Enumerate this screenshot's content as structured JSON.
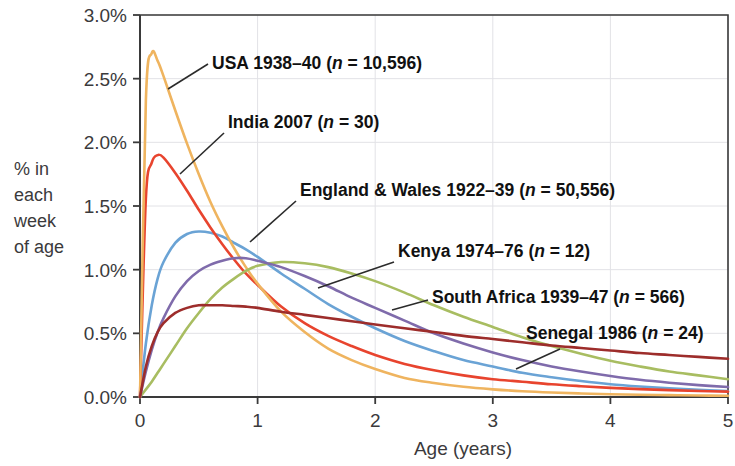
{
  "chart_data": {
    "type": "line",
    "title": "",
    "xlabel": "Age (years)",
    "ylabel": "% in each week of age",
    "ylabel_lines": [
      "% in",
      "each",
      "week",
      "of age"
    ],
    "xlim": [
      0,
      5
    ],
    "ylim": [
      0,
      3.0
    ],
    "grid": true,
    "legend_position": "inline-annotations",
    "x_ticks": [
      {
        "value": 0,
        "label": "0"
      },
      {
        "value": 1,
        "label": "1"
      },
      {
        "value": 2,
        "label": "2"
      },
      {
        "value": 3,
        "label": "3"
      },
      {
        "value": 4,
        "label": "4"
      },
      {
        "value": 5,
        "label": "5"
      }
    ],
    "y_ticks": [
      {
        "value": 0.0,
        "label": "0.0%"
      },
      {
        "value": 0.5,
        "label": "0.5%"
      },
      {
        "value": 1.0,
        "label": "1.0%"
      },
      {
        "value": 1.5,
        "label": "1.5%"
      },
      {
        "value": 2.0,
        "label": "2.0%"
      },
      {
        "value": 2.5,
        "label": "2.5%"
      },
      {
        "value": 3.0,
        "label": "3.0%"
      }
    ],
    "x": [
      0,
      0.05,
      0.1,
      0.15,
      0.2,
      0.3,
      0.4,
      0.5,
      0.6,
      0.7,
      0.8,
      0.9,
      1.0,
      1.2,
      1.4,
      1.6,
      1.8,
      2.0,
      2.25,
      2.5,
      2.75,
      3.0,
      3.25,
      3.5,
      3.75,
      4.0,
      4.25,
      4.5,
      4.75,
      5.0
    ],
    "series": [
      {
        "name": "USA 1938-40",
        "label": "USA 1938–40 (n = 10,596)",
        "label_prefix": "USA 1938–40 (",
        "label_italic": "n",
        "label_suffix": " = 10,596)",
        "n": "10,596",
        "color": "#efb45f",
        "peak_value": 2.7,
        "peak_age": 0.09,
        "values": [
          0.0,
          2.33,
          2.7,
          2.64,
          2.52,
          2.25,
          1.99,
          1.75,
          1.53,
          1.34,
          1.17,
          1.02,
          0.89,
          0.67,
          0.51,
          0.38,
          0.29,
          0.22,
          0.15,
          0.11,
          0.08,
          0.06,
          0.045,
          0.035,
          0.028,
          0.022,
          0.018,
          0.015,
          0.012,
          0.01
        ]
      },
      {
        "name": "India 2007",
        "label": "India 2007 (n = 30)",
        "label_prefix": "India 2007 (",
        "label_italic": "n",
        "label_suffix": " = 30)",
        "n": "30",
        "color": "#e8442e",
        "peak_value": 1.9,
        "peak_age": 0.13,
        "values": [
          0.0,
          1.56,
          1.84,
          1.9,
          1.88,
          1.76,
          1.62,
          1.47,
          1.33,
          1.2,
          1.08,
          0.97,
          0.88,
          0.71,
          0.58,
          0.48,
          0.4,
          0.33,
          0.26,
          0.21,
          0.17,
          0.14,
          0.12,
          0.1,
          0.085,
          0.072,
          0.062,
          0.054,
          0.047,
          0.042
        ]
      },
      {
        "name": "England & Wales 1922-39",
        "label": "England & Wales 1922–39 (n = 50,556)",
        "label_prefix": "England & Wales 1922–39 (",
        "label_italic": "n",
        "label_suffix": " = 50,556)",
        "n": "50,556",
        "color": "#6aa3d5",
        "peak_value": 1.3,
        "peak_age": 0.48,
        "values": [
          0.0,
          0.42,
          0.72,
          0.93,
          1.06,
          1.21,
          1.28,
          1.3,
          1.29,
          1.26,
          1.21,
          1.16,
          1.1,
          0.97,
          0.85,
          0.73,
          0.63,
          0.54,
          0.44,
          0.36,
          0.29,
          0.24,
          0.19,
          0.155,
          0.125,
          0.1,
          0.082,
          0.068,
          0.056,
          0.047
        ]
      },
      {
        "name": "Kenya 1974-76",
        "label": "Kenya 1974–76 (n = 12)",
        "label_prefix": "Kenya 1974–76 (",
        "label_italic": "n",
        "label_suffix": " = 12)",
        "n": "12",
        "color": "#7f6bab",
        "peak_value": 1.09,
        "peak_age": 0.8,
        "values": [
          0.0,
          0.2,
          0.37,
          0.51,
          0.62,
          0.79,
          0.91,
          0.99,
          1.04,
          1.07,
          1.09,
          1.09,
          1.07,
          1.02,
          0.95,
          0.87,
          0.78,
          0.7,
          0.6,
          0.5,
          0.42,
          0.35,
          0.29,
          0.24,
          0.2,
          0.165,
          0.135,
          0.112,
          0.093,
          0.078
        ]
      },
      {
        "name": "South Africa 1939-47",
        "label": "South Africa 1939–47 (n = 566)",
        "label_prefix": "South Africa 1939–47 (",
        "label_italic": "n",
        "label_suffix": " = 566)",
        "n": "566",
        "color": "#9d2d2b",
        "peak_value": 0.72,
        "peak_age": 0.62,
        "values": [
          0.0,
          0.24,
          0.4,
          0.51,
          0.58,
          0.66,
          0.7,
          0.72,
          0.72,
          0.72,
          0.715,
          0.71,
          0.7,
          0.67,
          0.645,
          0.62,
          0.595,
          0.57,
          0.54,
          0.51,
          0.48,
          0.455,
          0.43,
          0.405,
          0.385,
          0.365,
          0.345,
          0.33,
          0.315,
          0.3
        ]
      },
      {
        "name": "Senegal 1986",
        "label": "Senegal 1986 (n = 24)",
        "label_prefix": "Senegal 1986 (",
        "label_italic": "n",
        "label_suffix": " = 24)",
        "n": "24",
        "color": "#a8bd61",
        "peak_value": 1.06,
        "peak_age": 1.18,
        "values": [
          0.0,
          0.06,
          0.12,
          0.19,
          0.26,
          0.4,
          0.54,
          0.66,
          0.77,
          0.86,
          0.93,
          0.99,
          1.03,
          1.06,
          1.05,
          1.02,
          0.97,
          0.91,
          0.82,
          0.72,
          0.63,
          0.55,
          0.47,
          0.4,
          0.34,
          0.285,
          0.24,
          0.2,
          0.17,
          0.14
        ]
      }
    ],
    "annotations": [
      {
        "series": "USA 1938-40",
        "text_x": 212,
        "text_y": 69,
        "leader": "M168,89 L208,64"
      },
      {
        "series": "India 2007",
        "text_x": 228,
        "text_y": 128,
        "leader": "M180,174 L224,133"
      },
      {
        "series": "England & Wales 1922-39",
        "text_x": 300,
        "text_y": 196,
        "leader": "M250,242 L296,201"
      },
      {
        "series": "Kenya 1974-76",
        "text_x": 398,
        "text_y": 257,
        "leader": "M318,288 L394,262"
      },
      {
        "series": "South Africa 1939-47",
        "text_x": 432,
        "text_y": 303,
        "leader": "M392,310 L428,300"
      },
      {
        "series": "Senegal 1986",
        "text_x": 526,
        "text_y": 339,
        "leader": "M516,369 L560,349"
      }
    ]
  }
}
